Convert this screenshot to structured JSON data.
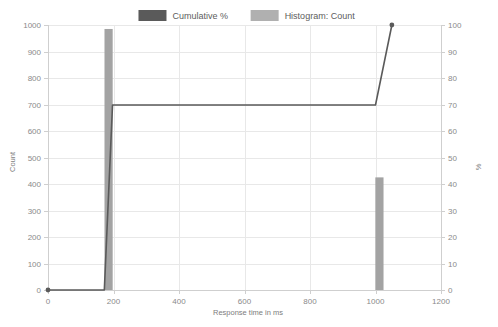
{
  "chart_data": {
    "type": "bar",
    "title": "",
    "subtitle": "",
    "xlabel": "Response time in ms",
    "ylabel": "Count",
    "y2label": "%",
    "xlim": [
      0,
      1200
    ],
    "ylim": [
      0,
      1000
    ],
    "y2lim": [
      0,
      100
    ],
    "xticks": [
      "0",
      "200",
      "400",
      "600",
      "800",
      "1000",
      "1200"
    ],
    "xtick_values": [
      0,
      200,
      400,
      600,
      800,
      1000,
      1200
    ],
    "yticks": [
      "0",
      "100",
      "200",
      "300",
      "400",
      "500",
      "600",
      "700",
      "800",
      "900",
      "1000"
    ],
    "ytick_values": [
      0,
      100,
      200,
      300,
      400,
      500,
      600,
      700,
      800,
      900,
      1000
    ],
    "y2ticks": [
      "0",
      "10",
      "20",
      "30",
      "40",
      "50",
      "60",
      "70",
      "80",
      "90",
      "100"
    ],
    "y2tick_values": [
      0,
      10,
      20,
      30,
      40,
      50,
      60,
      70,
      80,
      90,
      100
    ],
    "grid": true,
    "legend_position": "top-center",
    "series": [
      {
        "name": "Histogram: Count",
        "type": "bar",
        "axis": "left",
        "color": "#a3a3a3",
        "bar_width_ms": 25,
        "points": [
          {
            "x": 185,
            "y": 985
          },
          {
            "x": 1012,
            "y": 425
          }
        ]
      },
      {
        "name": "Cumulative %",
        "type": "line",
        "axis": "right",
        "color": "#5a5a5a",
        "marker": "dot",
        "points": [
          {
            "x": 0,
            "y": 0
          },
          {
            "x": 172,
            "y": 0
          },
          {
            "x": 197,
            "y": 69.8
          },
          {
            "x": 1000,
            "y": 69.8
          },
          {
            "x": 1050,
            "y": 100
          }
        ]
      }
    ]
  },
  "legend": {
    "items": [
      {
        "label": "Cumulative %",
        "color": "#5a5a5a"
      },
      {
        "label": "Histogram: Count",
        "color": "#b0b0b0"
      }
    ]
  }
}
